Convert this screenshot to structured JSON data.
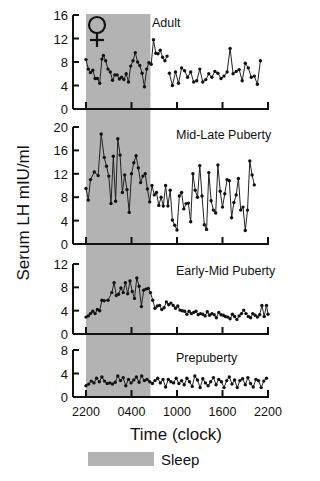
{
  "chart_data": {
    "type": "line",
    "title": "",
    "ylabel": "Serum LH mIU/ml",
    "xlabel": "Time (clock)",
    "x_ticks": [
      "2200",
      "0400",
      "1000",
      "1600",
      "2200"
    ],
    "x_range_hours": [
      0,
      24
    ],
    "sleep_band_hours": [
      0,
      8.5
    ],
    "legend": [
      {
        "label": "Sleep",
        "color": "#b3b3b3"
      }
    ],
    "annotation": {
      "symbol": "♀",
      "meaning": "female"
    },
    "panels": [
      {
        "name": "Adult",
        "ylim": [
          0,
          16
        ],
        "yticks": [
          0,
          4,
          8,
          12,
          16
        ],
        "series": [
          {
            "x": [
              0,
              0.3,
              0.6,
              0.9,
              1.2,
              1.5,
              1.8,
              2.1,
              2.3,
              2.6,
              2.9,
              3.2,
              3.5,
              3.8,
              4.1,
              4.4,
              4.7,
              5.0,
              5.3,
              5.6,
              5.9,
              6.2,
              6.5,
              6.8,
              7.1,
              7.4,
              7.7,
              8.0,
              8.3,
              8.6,
              8.9,
              9.2,
              9.5,
              9.8,
              10.1,
              10.4,
              10.7,
              11.0,
              11.3,
              11.6,
              11.9
            ],
            "y": [
              8.4,
              6.8,
              6.2,
              6.6,
              5.2,
              5.2,
              4.4,
              8.5,
              9.1,
              8.2,
              6.8,
              6.3,
              4.9,
              5.8,
              5.8,
              5.1,
              5.4,
              5.0,
              6.0,
              4.6,
              7.3,
              8.2,
              9.6,
              8.0,
              7.4,
              6.1,
              3.8,
              6.8,
              7.9,
              7.6,
              11.8,
              9.5,
              9.4,
              10.0,
              8.8,
              8.2,
              9.0
            ]
          },
          {
            "x": [
              11.0,
              11.4,
              11.8,
              12.2,
              12.6,
              13.0,
              13.4,
              13.8,
              14.2,
              14.6,
              15.0,
              15.4,
              15.8,
              16.2,
              16.6,
              17.0,
              17.4,
              17.8,
              18.2,
              18.6,
              19.0,
              19.4,
              19.8,
              20.2,
              20.6,
              21.0,
              21.4,
              21.8,
              22.2,
              22.6,
              23.0,
              23.4,
              23.7,
              24.0
            ],
            "y": [
              6.1,
              4.0,
              6.3,
              4.4,
              7.0,
              6.5,
              5.4,
              6.3,
              4.6,
              4.8,
              6.8,
              4.6,
              5.0,
              6.0,
              5.4,
              6.4,
              6.1,
              5.2,
              5.6,
              6.3,
              10.3,
              6.0,
              6.4,
              6.7,
              4.8,
              7.8,
              7.0,
              5.4,
              5.6,
              4.2,
              8.2
            ]
          }
        ]
      },
      {
        "name": "Mid-Late Puberty",
        "ylim": [
          0,
          20
        ],
        "yticks": [
          0,
          4,
          8,
          12,
          16,
          20
        ],
        "series": [
          {
            "x": [
              0,
              0.3,
              0.6,
              1.1,
              1.6,
              2.0,
              2.4,
              2.7,
              3.0,
              3.3,
              3.6,
              3.9,
              4.2,
              4.5,
              4.8,
              5.1,
              5.4,
              5.7,
              6.0,
              6.3,
              6.6,
              6.9,
              7.2,
              7.5,
              7.8,
              8.1,
              8.4,
              8.7,
              9.0,
              9.3,
              9.6,
              9.9,
              10.2,
              10.5,
              10.8,
              11.1,
              11.4,
              11.7,
              12.0,
              12.3,
              12.6,
              12.9,
              13.2,
              13.5,
              13.8,
              14.1,
              14.4,
              14.7,
              15.0,
              15.3,
              15.6,
              15.9,
              16.2,
              16.5,
              16.8,
              17.1,
              17.4,
              17.7,
              18.0,
              18.3,
              18.6,
              18.9,
              19.2,
              19.5,
              19.8,
              20.1,
              20.4,
              20.7,
              21.0,
              21.3,
              21.6,
              21.9,
              22.2,
              22.5,
              22.8,
              23.1,
              23.4,
              23.7,
              24.0
            ],
            "y": [
              9.5,
              7.5,
              11.0,
              12.3,
              11.7,
              18.8,
              14.8,
              13.3,
              11.6,
              6.9,
              15.0,
              7.3,
              18.0,
              15.2,
              8.8,
              11.8,
              9.3,
              5.4,
              12.0,
              13.9,
              15.1,
              13.0,
              10.5,
              11.6,
              12.0,
              9.4,
              7.2,
              10.0,
              8.4,
              8.8,
              6.6,
              8.0,
              6.5,
              10.0,
              6.5,
              9.2,
              4.1,
              3.2,
              2.4,
              8.2,
              8.8,
              6.0,
              6.9,
              7.0,
              3.8,
              12.0,
              9.2,
              8.0,
              13.4,
              8.2,
              3.3,
              2.5,
              12.2,
              7.4,
              5.8,
              5.3,
              13.5,
              9.0,
              6.3,
              8.6,
              11.0,
              10.8,
              4.5,
              7.1,
              8.4,
              11.2,
              5.8,
              6.3,
              2.3,
              5.8,
              14.2,
              11.8,
              10.1
            ]
          }
        ]
      },
      {
        "name": "Early-Mid Puberty",
        "ylim": [
          0,
          12
        ],
        "yticks": [
          0,
          4,
          8,
          12
        ],
        "series": [
          {
            "x": [
              0,
              0.3,
              0.6,
              0.9,
              1.2,
              1.5,
              1.8,
              2.1,
              2.4,
              2.9,
              3.4,
              3.7,
              4.0,
              4.3,
              4.6,
              4.9,
              5.2,
              5.5,
              5.8,
              6.1,
              6.4,
              6.7,
              7.0,
              7.3,
              7.6,
              7.9,
              8.2,
              8.5,
              8.8,
              9.1,
              9.4,
              9.7,
              10.0,
              10.3,
              10.6,
              10.9,
              11.2,
              11.5,
              11.8,
              12.1,
              12.4,
              12.7,
              13.0,
              13.3,
              13.6,
              13.9,
              14.2,
              14.5,
              14.8,
              15.1,
              15.4,
              15.7,
              16.0,
              16.3,
              16.6,
              16.9,
              17.2,
              17.5,
              17.8,
              18.1,
              18.4,
              18.7,
              19.0,
              19.3,
              19.6,
              19.9,
              20.2,
              20.5,
              20.8,
              21.1,
              21.4,
              21.7,
              22.0,
              22.3,
              22.6,
              22.9,
              23.2,
              23.5,
              23.8,
              24.0
            ],
            "y": [
              2.9,
              3.1,
              3.5,
              3.9,
              3.5,
              4.2,
              4.0,
              5.8,
              5.7,
              5.8,
              7.1,
              8.8,
              6.6,
              6.8,
              7.9,
              7.1,
              8.8,
              6.9,
              9.1,
              7.3,
              6.1,
              9.6,
              8.2,
              4.7,
              7.5,
              7.7,
              7.8,
              7.1,
              5.8,
              4.4,
              4.8,
              4.9,
              4.2,
              4.5,
              5.5,
              5.0,
              5.3,
              4.9,
              4.4,
              4.8,
              4.1,
              4.0,
              3.9,
              3.4,
              3.9,
              3.5,
              3.7,
              3.9,
              3.3,
              3.5,
              3.4,
              3.1,
              3.8,
              3.2,
              3.5,
              3.3,
              2.8,
              3.7,
              3.3,
              3.2,
              3.0,
              2.9,
              2.6,
              3.4,
              3.0,
              2.5,
              3.1,
              3.5,
              4.1,
              3.5,
              3.0,
              2.8,
              3.5,
              3.2,
              2.9,
              3.3,
              4.9,
              3.0,
              4.9,
              3.4
            ]
          }
        ]
      },
      {
        "name": "Prepuberty",
        "ylim": [
          0,
          8
        ],
        "yticks": [
          0,
          4,
          8
        ],
        "series": [
          {
            "x": [
              0,
              0.35,
              0.7,
              1.05,
              1.4,
              1.75,
              2.1,
              2.45,
              2.8,
              3.15,
              3.5,
              3.85,
              4.2,
              4.55,
              4.9,
              5.25,
              5.6,
              5.95,
              6.3,
              6.65,
              7.0,
              7.35,
              7.7,
              8.05,
              8.4,
              8.75,
              9.1,
              9.45,
              9.8,
              10.15,
              10.5,
              10.85,
              11.2,
              11.55,
              11.9,
              12.25,
              12.6,
              12.95,
              13.3,
              13.65,
              14.0,
              14.35,
              14.7,
              15.05,
              15.4,
              15.75,
              16.1,
              16.45,
              16.8,
              17.15,
              17.5,
              17.85,
              18.2,
              18.55,
              18.9,
              19.25,
              19.6,
              19.95,
              20.3,
              20.65,
              21.0,
              21.35,
              21.7,
              22.05,
              22.4,
              22.75,
              23.1,
              23.45,
              23.8
            ],
            "y": [
              1.9,
              2.2,
              2.7,
              2.4,
              3.2,
              2.6,
              3.4,
              2.7,
              2.3,
              2.4,
              2.2,
              2.5,
              3.6,
              2.8,
              3.3,
              1.9,
              3.0,
              2.4,
              2.9,
              3.4,
              2.5,
              3.6,
              2.8,
              3.0,
              2.6,
              2.3,
              2.8,
              3.2,
              2.4,
              3.0,
              1.7,
              3.0,
              2.6,
              2.4,
              3.2,
              2.3,
              2.8,
              2.1,
              3.2,
              2.6,
              1.8,
              3.6,
              2.9,
              1.6,
              3.1,
              2.4,
              1.9,
              2.6,
              3.3,
              2.1,
              3.0,
              2.6,
              1.6,
              2.8,
              3.4,
              2.2,
              2.9,
              1.6,
              2.8,
              3.1,
              2.1,
              3.3,
              2.3,
              1.7,
              3.0,
              2.8,
              1.6,
              2.7,
              3.2
            ]
          }
        ]
      }
    ]
  },
  "colors": {
    "sleep_band": "#b3b3b3",
    "axis": "#111111",
    "line": "#222222",
    "marker": "#111111"
  }
}
